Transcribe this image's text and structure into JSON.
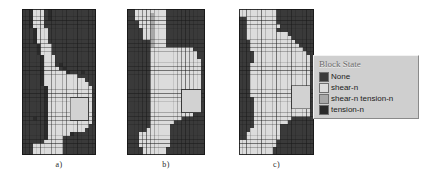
{
  "figure": {
    "background": "#ffffff",
    "panels": [
      {
        "id": "a",
        "label": "a)",
        "x": 22,
        "y": 9,
        "width": 74,
        "height": 146
      },
      {
        "id": "b",
        "label": "b)",
        "x": 127,
        "y": 9,
        "width": 78,
        "height": 146
      },
      {
        "id": "c",
        "label": "c)",
        "x": 239,
        "y": 9,
        "width": 75,
        "height": 146
      }
    ]
  },
  "legend": {
    "title": "Block State",
    "items": [
      {
        "label": "None",
        "color": "#3a3a3a"
      },
      {
        "label": "shear-n",
        "color": "#dcdcdc"
      },
      {
        "label": "shear-n tension-n",
        "color": "#a8a8a8"
      },
      {
        "label": "tension-n",
        "color": "#2b2b2b"
      }
    ]
  },
  "chart_data": {
    "type": "heatmap",
    "title": "Block State",
    "xlabel": "",
    "ylabel": "",
    "grid": true,
    "legend_position": "right",
    "state_colors": {
      "None": "#3a3a3a",
      "shear-n": "#dcdcdc",
      "shear-n tension-n": "#a8a8a8",
      "tension-n": "#2b2b2b"
    },
    "state_codes": {
      "0": "None",
      "1": "shear-n",
      "2": "shear-n tension-n",
      "3": "tension-n"
    },
    "cols": 20,
    "rows": 38,
    "inclusion_color": "#d2d2d2",
    "panels": [
      {
        "id": "a",
        "label": "a)",
        "inclusion": {
          "col": 13,
          "row": 23,
          "cols": 5,
          "rows": 6
        },
        "cells": [
          "00311103000000000000",
          "00311103000000000000",
          "00311103000000000000",
          "00311100000000000000",
          "00311100000000000000",
          "00031110000000000000",
          "00031110000000000000",
          "00031110000000000000",
          "00031110000000000000",
          "00003111000000000000",
          "00003111000000000000",
          "00003111000000000000",
          "00000311100000000000",
          "00000311100000000000",
          "00000311103000000000",
          "00000311110300000000",
          "00000311111130003000",
          "00000311111111100000",
          "00000311111111111000",
          "00000311111111111100",
          "00000031111111111110",
          "00000031111111111110",
          "00000031111111111110",
          "00000031111111111110",
          "00000031111111111110",
          "00000031111111111110",
          "00000031111111111110",
          "00000031111111111110",
          "00030031111111111110",
          "00000031111111111110",
          "00000031111111111100",
          "00000031111111111000",
          "00000031111113000000",
          "00000031111000000000",
          "00000011111000000000",
          "00011111111000000000",
          "00011111111000000000",
          "00011111111000000000"
        ]
      },
      {
        "id": "b",
        "label": "b)",
        "inclusion": {
          "col": 14,
          "row": 21,
          "cols": 5,
          "rows": 6
        },
        "cells": [
          "00111111110000000000",
          "00111121110000000000",
          "00111121110000000000",
          "00011121110000000000",
          "00011121110000000000",
          "00001121110000000000",
          "00001121110000000000",
          "00001121110000000000",
          "00000021110000000000",
          "00000021110000000000",
          "00000011111111111000",
          "00000011111111111100",
          "00000011111111111100",
          "00000011111111111110",
          "00000011111111111110",
          "00000011111111111110",
          "00000011111111111110",
          "00000011111111111110",
          "00000011111111111110",
          "00000011111111111110",
          "00000011111111111110",
          "00000011111111111110",
          "00000011111111111110",
          "00000011111111111110",
          "00000011111111111110",
          "00000011111111111110",
          "00000011111111131110",
          "00000011111111111000",
          "00000011111111000000",
          "00000011111100000000",
          "00000011111000000000",
          "00000111111000000000",
          "00011111111000000000",
          "00011111111000000000",
          "00011111111000000000",
          "00011111111000000000",
          "00001111110000000000",
          "00001111110000000000"
        ]
      },
      {
        "id": "c",
        "label": "c)",
        "inclusion": {
          "col": 14,
          "row": 20,
          "cols": 5,
          "rows": 6
        },
        "cells": [
          "11111111110000000000",
          "11111111110000000000",
          "00111111110000000000",
          "00111111110000000000",
          "00111111111000000000",
          "00111111110000000000",
          "00111111111110000000",
          "00111111111111000000",
          "00011111111111100000",
          "00011111111111110000",
          "00011111111111111000",
          "00001111111111111100",
          "00001111111111111110",
          "00001111111111111110",
          "00011111111111111110",
          "00011111111111111110",
          "00011111111111111110",
          "00011111111111111110",
          "00011111111111111110",
          "00011111111111111110",
          "00011111111111111110",
          "00011111111111111110",
          "00011111111111111110",
          "00001111111111111110",
          "00001111111111111110",
          "00001111111111111110",
          "00001111111111111110",
          "00001111111111111110",
          "00001111111111000000",
          "00001111111110000000",
          "00001111111000000000",
          "00011111111000000000",
          "00111111111000000000",
          "00111111111000000000",
          "11111111110000000000",
          "11111111110000000000",
          "11111111100000000000",
          "11111111100000000000"
        ]
      }
    ]
  }
}
